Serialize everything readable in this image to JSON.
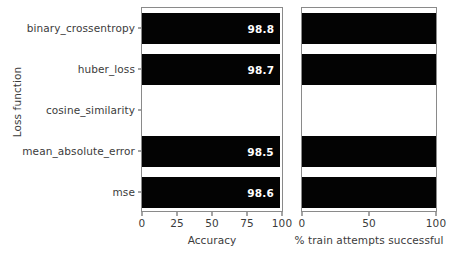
{
  "chart_data": {
    "type": "bar",
    "orientation": "horizontal",
    "title": "",
    "ylabel": "Loss function",
    "grid": false,
    "legend": null,
    "categories": [
      "binary_crossentropy",
      "huber_loss",
      "cosine_similarity",
      "mean_absolute_error",
      "mse"
    ],
    "panels": [
      {
        "name": "accuracy-panel",
        "xlabel": "Accuracy",
        "xlim": [
          0,
          100
        ],
        "xticks": [
          0,
          25,
          50,
          75,
          100
        ],
        "xtick_labels": [
          "0",
          "25",
          "50",
          "75",
          "100"
        ],
        "values": [
          98.8,
          98.7,
          0,
          98.5,
          98.6
        ],
        "bar_labels": [
          "98.8",
          "98.7",
          "",
          "98.5",
          "98.6"
        ],
        "bar_color": "#030303"
      },
      {
        "name": "train-success-panel",
        "xlabel": "% train attempts successful",
        "xlim": [
          0,
          100
        ],
        "xticks": [
          0,
          50,
          100
        ],
        "xtick_labels": [
          "0",
          "50",
          "100"
        ],
        "values": [
          100,
          100,
          0,
          100,
          100
        ],
        "bar_labels": [
          "",
          "",
          "",
          "",
          ""
        ],
        "bar_color": "#030303"
      }
    ]
  },
  "colors": {
    "bar": "#030303",
    "axis": "#8a8a8a",
    "text": "#3b3b3b",
    "background": "#ffffff",
    "bar_label_text": "#ffffff"
  }
}
